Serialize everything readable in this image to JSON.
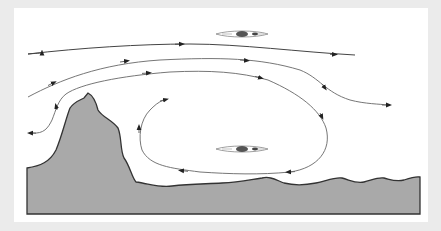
{
  "diagram": {
    "type": "flow-diagram",
    "colors": {
      "background_frame": "#ebebeb",
      "panel": "#ffffff",
      "terrain_fill": "#a9a9a9",
      "terrain_stroke": "#333333",
      "flow_line": "#555555",
      "arrow": "#222222"
    },
    "elements": {
      "terrain": {
        "label": "rock-outcrop-and-bank"
      },
      "kayaks": [
        {
          "label": "kayak-upstream",
          "position": "top"
        },
        {
          "label": "kayak-in-eddy",
          "position": "center"
        }
      ],
      "flow_lines": [
        {
          "label": "main-current-top",
          "direction": "right"
        },
        {
          "label": "main-current-second",
          "direction": "right"
        },
        {
          "label": "main-current-third",
          "direction": "right"
        },
        {
          "label": "eddy-loop",
          "direction": "counter-clockwise"
        },
        {
          "label": "eddy-back-flow-left",
          "direction": "left"
        }
      ]
    }
  }
}
